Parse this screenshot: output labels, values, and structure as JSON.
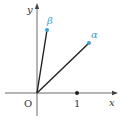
{
  "diagram": {
    "axes": {
      "x_label": "x",
      "y_label": "y",
      "origin_label": "O",
      "tick_label": "1"
    },
    "vectors": [
      {
        "name": "alpha",
        "label": "α",
        "color": "#3aa0d8"
      },
      {
        "name": "beta",
        "label": "β",
        "color": "#3aa0d8"
      }
    ],
    "colors": {
      "axis": "#444444",
      "vector_line": "#222222",
      "point_accent": "#3aa0d8",
      "tick_point": "#222222"
    }
  }
}
